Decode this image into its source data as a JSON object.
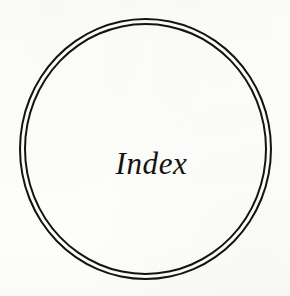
{
  "page": {
    "type": "book-section-divider",
    "background_color": "#fdfdfc",
    "ink_color": "#15120f"
  },
  "emblem": {
    "shape_name": "double-ring-circle",
    "ring_count": 2,
    "outer_ring": {
      "stroke_color": "#15120f"
    },
    "inner_ring": {
      "stroke_color": "#15120f"
    },
    "label": "Index"
  }
}
